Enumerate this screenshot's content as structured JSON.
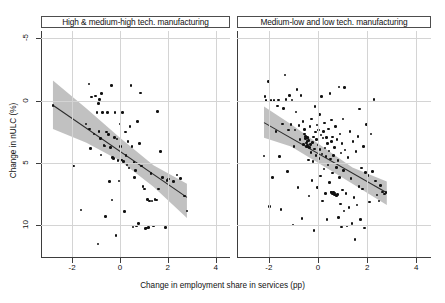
{
  "chart_data": {
    "type": "scatter",
    "title": "",
    "xlabel": "Change in employment share in services (pp)",
    "ylabel": "Change in nULC (%)",
    "xlim": [
      -3.3,
      4.6
    ],
    "ylim": [
      -7.6,
      10.6
    ],
    "xticks": [
      -2,
      0,
      2,
      4
    ],
    "xticklabels": [
      "-2",
      "0",
      "2",
      "4"
    ],
    "yticks": [
      -5,
      0,
      5,
      10
    ],
    "yticklabels": [
      "-5",
      "0",
      "5",
      "10"
    ],
    "grid": true,
    "grid_axis": "both",
    "legend": "none",
    "marker_color": "#111111",
    "fit_line_color": "#2b2b2b",
    "ci_band_color": "#9b9b9b",
    "panels": [
      {
        "label": "High & medium-high tech. manufacturing",
        "n_points": 85,
        "fit": {
          "x0": -2.8,
          "y0": 4.62,
          "x1": 2.8,
          "y1": -2.8,
          "slope": -1.325,
          "intercept": 0.91
        },
        "ci_upper": [
          [
            -2.8,
            6.62
          ],
          [
            -1.4,
            4.35
          ],
          [
            0.0,
            2.0
          ],
          [
            1.4,
            -0.22
          ],
          [
            2.8,
            -1.7
          ]
        ],
        "ci_lower": [
          [
            -2.8,
            2.7
          ],
          [
            -1.4,
            1.6
          ],
          [
            0.0,
            0.15
          ],
          [
            1.4,
            -1.95
          ],
          [
            2.8,
            -4.45
          ]
        ],
        "points": [
          [
            -2.8,
            4.62
          ],
          [
            -1.94,
            -0.26
          ],
          [
            -1.62,
            -3.82
          ],
          [
            -1.42,
            3.12
          ],
          [
            -1.3,
            6.32
          ],
          [
            -1.28,
            2.7
          ],
          [
            -1.22,
            1.12
          ],
          [
            -1.2,
            5.28
          ],
          [
            -1.08,
            2.3
          ],
          [
            -1.02,
            5.38
          ],
          [
            -0.96,
            4.02
          ],
          [
            -0.92,
            -6.55
          ],
          [
            -0.9,
            4.75
          ],
          [
            -0.88,
            2.52
          ],
          [
            -0.86,
            5.08
          ],
          [
            -0.82,
            1.92
          ],
          [
            -0.8,
            0.6
          ],
          [
            -0.76,
            5.58
          ],
          [
            -0.72,
            4.05
          ],
          [
            -0.66,
            1.4
          ],
          [
            -0.62,
            1.34
          ],
          [
            -0.6,
            -4.32
          ],
          [
            -0.56,
            2.46
          ],
          [
            -0.52,
            4.02
          ],
          [
            -0.48,
            2.28
          ],
          [
            -0.44,
            -1.5
          ],
          [
            -0.4,
            1.22
          ],
          [
            -0.36,
            6.22
          ],
          [
            -0.34,
            -3.02
          ],
          [
            -0.3,
            0.42
          ],
          [
            -0.26,
            0.32
          ],
          [
            -0.22,
            2.04
          ],
          [
            -0.2,
            4.02
          ],
          [
            -0.16,
            -5.88
          ],
          [
            -0.12,
            1.9
          ],
          [
            -0.08,
            0.18
          ],
          [
            -0.04,
            -1.48
          ],
          [
            0.0,
            3.1
          ],
          [
            0.02,
            1.28
          ],
          [
            0.06,
            0.22
          ],
          [
            0.1,
            4.02
          ],
          [
            0.14,
            0.08
          ],
          [
            0.18,
            -3.95
          ],
          [
            0.22,
            2.48
          ],
          [
            0.26,
            0.56
          ],
          [
            0.3,
            -0.18
          ],
          [
            0.34,
            1.68
          ],
          [
            0.38,
            -0.42
          ],
          [
            0.42,
            2.9
          ],
          [
            0.46,
            6.22
          ],
          [
            0.5,
            1.3
          ],
          [
            0.54,
            -5.18
          ],
          [
            0.58,
            0.02
          ],
          [
            0.62,
            -1.22
          ],
          [
            0.66,
            -0.62
          ],
          [
            0.7,
            -5.1
          ],
          [
            0.74,
            3.3
          ],
          [
            0.78,
            -4.92
          ],
          [
            0.82,
            1.52
          ],
          [
            0.86,
            5.6
          ],
          [
            0.9,
            -0.28
          ],
          [
            0.96,
            -1.92
          ],
          [
            1.02,
            -2.12
          ],
          [
            1.06,
            -5.3
          ],
          [
            1.1,
            -5.28
          ],
          [
            1.16,
            -2.98
          ],
          [
            1.2,
            -5.22
          ],
          [
            1.24,
            -3.1
          ],
          [
            1.3,
            -0.88
          ],
          [
            1.34,
            -3.08
          ],
          [
            1.4,
            -5.12
          ],
          [
            1.46,
            -2.96
          ],
          [
            1.52,
            -3.02
          ],
          [
            1.58,
            4.1
          ],
          [
            1.62,
            -2.12
          ],
          [
            1.7,
            0.88
          ],
          [
            1.78,
            -1.18
          ],
          [
            1.9,
            -5.22
          ],
          [
            1.96,
            -1.42
          ],
          [
            2.04,
            -1.32
          ],
          [
            2.24,
            -1.5
          ],
          [
            2.38,
            -0.98
          ],
          [
            2.52,
            -1.3
          ],
          [
            2.7,
            -2.7
          ],
          [
            2.8,
            -3.88
          ]
        ]
      },
      {
        "label": "Medium-low and low tech. manufacturing",
        "n_points": 158,
        "fit": {
          "x0": -2.2,
          "y0": 3.22,
          "x1": 2.8,
          "y1": -2.42,
          "slope": -1.128,
          "intercept": 0.74
        },
        "ci_upper": [
          [
            -2.2,
            4.52
          ],
          [
            -1.1,
            3.1
          ],
          [
            0.0,
            1.55
          ],
          [
            1.4,
            -0.4
          ],
          [
            2.8,
            -1.52
          ]
        ],
        "ci_lower": [
          [
            -2.2,
            2.0
          ],
          [
            -1.1,
            1.3
          ],
          [
            0.0,
            0.0
          ],
          [
            1.4,
            -1.7
          ],
          [
            2.8,
            -3.42
          ]
        ],
        "points": [
          [
            -2.2,
            0.52
          ],
          [
            -2.16,
            5.32
          ],
          [
            -2.12,
            5.02
          ],
          [
            -2.02,
            6.55
          ],
          [
            -1.98,
            -3.52
          ],
          [
            -1.92,
            5.02
          ],
          [
            -1.86,
            -1.18
          ],
          [
            -1.8,
            5.02
          ],
          [
            -1.72,
            2.52
          ],
          [
            -1.66,
            4.55
          ],
          [
            -1.6,
            5.05
          ],
          [
            -1.56,
            0.48
          ],
          [
            -1.5,
            -3.78
          ],
          [
            -1.44,
            3.12
          ],
          [
            -1.4,
            4.38
          ],
          [
            -1.34,
            7.05
          ],
          [
            -1.3,
            5.1
          ],
          [
            -1.24,
            -0.7
          ],
          [
            -1.2,
            2.62
          ],
          [
            -1.16,
            5.42
          ],
          [
            -1.1,
            3.05
          ],
          [
            -1.06,
            5.05
          ],
          [
            -1.02,
            -5.02
          ],
          [
            -0.98,
            1.32
          ],
          [
            -0.94,
            2.62
          ],
          [
            -0.9,
            4.08
          ],
          [
            -0.86,
            5.88
          ],
          [
            -0.82,
            -2.02
          ],
          [
            -0.78,
            2.98
          ],
          [
            -0.74,
            1.88
          ],
          [
            -0.7,
            5.42
          ],
          [
            -0.66,
            -4.48
          ],
          [
            -0.62,
            3.3
          ],
          [
            -0.58,
            1.48
          ],
          [
            -0.56,
            2.3
          ],
          [
            -0.54,
            2.66
          ],
          [
            -0.52,
            1.92
          ],
          [
            -0.5,
            2.12
          ],
          [
            -0.48,
            1.28
          ],
          [
            -0.46,
            1.58
          ],
          [
            -0.44,
            2.02
          ],
          [
            -0.42,
            1.32
          ],
          [
            -0.4,
            1.8
          ],
          [
            -0.38,
            0.22
          ],
          [
            -0.36,
            -2.7
          ],
          [
            -0.34,
            1.22
          ],
          [
            -0.32,
            2.9
          ],
          [
            -0.3,
            1.48
          ],
          [
            -0.28,
            0.82
          ],
          [
            -0.26,
            3.52
          ],
          [
            -0.24,
            -1.42
          ],
          [
            -0.22,
            1.62
          ],
          [
            -0.2,
            0.08
          ],
          [
            -0.18,
            2.08
          ],
          [
            -0.16,
            -5.48
          ],
          [
            -0.14,
            1.1
          ],
          [
            -0.12,
            4.52
          ],
          [
            -0.1,
            2.48
          ],
          [
            -0.08,
            0.58
          ],
          [
            -0.06,
            1.88
          ],
          [
            -0.04,
            3.02
          ],
          [
            -0.02,
            -2.02
          ],
          [
            0.0,
            1.42
          ],
          [
            0.02,
            2.62
          ],
          [
            0.04,
            0.32
          ],
          [
            0.06,
            3.88
          ],
          [
            0.08,
            1.08
          ],
          [
            0.1,
            -1.08
          ],
          [
            0.12,
            2.22
          ],
          [
            0.14,
            5.32
          ],
          [
            0.16,
            0.68
          ],
          [
            0.18,
            -3.08
          ],
          [
            0.2,
            1.98
          ],
          [
            0.22,
            2.52
          ],
          [
            0.24,
            -0.52
          ],
          [
            0.26,
            3.18
          ],
          [
            0.28,
            1.18
          ],
          [
            0.3,
            -2.48
          ],
          [
            0.32,
            0.48
          ],
          [
            0.34,
            2.02
          ],
          [
            0.36,
            -4.58
          ],
          [
            0.38,
            1.52
          ],
          [
            0.4,
            -0.18
          ],
          [
            0.42,
            2.72
          ],
          [
            0.44,
            0.92
          ],
          [
            0.46,
            -1.58
          ],
          [
            0.48,
            5.58
          ],
          [
            0.5,
            0.28
          ],
          [
            0.52,
            -2.38
          ],
          [
            0.54,
            1.68
          ],
          [
            0.56,
            3.42
          ],
          [
            0.58,
            -0.82
          ],
          [
            0.6,
            2.08
          ],
          [
            0.62,
            -2.52
          ],
          [
            0.64,
            0.58
          ],
          [
            0.66,
            -2.58
          ],
          [
            0.68,
            1.22
          ],
          [
            0.7,
            -2.62
          ],
          [
            0.72,
            2.92
          ],
          [
            0.74,
            -0.38
          ],
          [
            0.76,
            -2.68
          ],
          [
            0.78,
            1.88
          ],
          [
            0.8,
            -2.55
          ],
          [
            0.82,
            0.18
          ],
          [
            0.84,
            -4.42
          ],
          [
            0.86,
            6.08
          ],
          [
            0.88,
            -1.18
          ],
          [
            0.9,
            2.32
          ],
          [
            0.92,
            -3.32
          ],
          [
            0.94,
            0.78
          ],
          [
            0.96,
            -5.18
          ],
          [
            0.98,
            1.52
          ],
          [
            1.0,
            -2.22
          ],
          [
            1.02,
            3.52
          ],
          [
            1.04,
            -0.62
          ],
          [
            1.06,
            -3.88
          ],
          [
            1.08,
            6.05
          ],
          [
            1.1,
            1.02
          ],
          [
            1.14,
            -2.48
          ],
          [
            1.18,
            -5.12
          ],
          [
            1.22,
            0.42
          ],
          [
            1.26,
            -3.62
          ],
          [
            1.3,
            2.52
          ],
          [
            1.34,
            -1.28
          ],
          [
            1.38,
            -4.92
          ],
          [
            1.42,
            1.68
          ],
          [
            1.46,
            -2.82
          ],
          [
            1.5,
            -6.18
          ],
          [
            1.54,
            0.88
          ],
          [
            1.58,
            -3.42
          ],
          [
            1.62,
            2.12
          ],
          [
            1.66,
            -1.92
          ],
          [
            1.7,
            4.32
          ],
          [
            1.74,
            -4.58
          ],
          [
            1.78,
            -0.42
          ],
          [
            1.82,
            -2.12
          ],
          [
            1.86,
            1.32
          ],
          [
            1.9,
            -5.28
          ],
          [
            1.98,
            3.08
          ],
          [
            2.04,
            -1.02
          ],
          [
            2.1,
            -3.18
          ],
          [
            2.16,
            2.32
          ],
          [
            2.22,
            -0.72
          ],
          [
            2.28,
            5.08
          ],
          [
            2.34,
            -1.48
          ],
          [
            2.4,
            -2.62
          ],
          [
            2.48,
            -3.08
          ],
          [
            2.54,
            -1.82
          ],
          [
            2.62,
            -2.38
          ],
          [
            2.7,
            -2.52
          ],
          [
            2.76,
            -2.42
          ],
          [
            0.55,
            -2.42
          ],
          [
            0.6,
            -2.48
          ],
          [
            0.64,
            -2.35
          ],
          [
            0.68,
            -2.45
          ],
          [
            -0.45,
            1.72
          ],
          [
            -0.43,
            1.42
          ],
          [
            -0.41,
            1.98
          ],
          [
            1.94,
            -0.78
          ]
        ]
      }
    ]
  },
  "axes": {
    "xlabel": "Change in employment share in services (pp)",
    "ylabel": "Change in nULC (%)",
    "xticklabels": [
      "-2",
      "0",
      "2",
      "4"
    ],
    "yticklabels": [
      "10",
      "5",
      "0",
      "-5"
    ]
  },
  "panel_titles": {
    "left": "High & medium-high tech. manufacturing",
    "right": "Medium-low and low tech. manufacturing"
  }
}
